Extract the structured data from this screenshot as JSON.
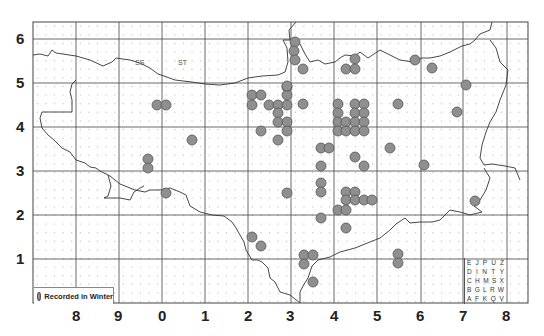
{
  "map": {
    "frame": {
      "left": 33,
      "top": 22,
      "right": 528,
      "bottom": 303
    },
    "grid_x": [
      76,
      119,
      162,
      205,
      248,
      291,
      334,
      377,
      421,
      463,
      507
    ],
    "grid_y": [
      39,
      83,
      127,
      171,
      215,
      259
    ],
    "x_labels": [
      {
        "text": "8",
        "x": 77
      },
      {
        "text": "9",
        "x": 119
      },
      {
        "text": "0",
        "x": 163
      },
      {
        "text": "1",
        "x": 206
      },
      {
        "text": "2",
        "x": 249
      },
      {
        "text": "3",
        "x": 291
      },
      {
        "text": "4",
        "x": 335
      },
      {
        "text": "5",
        "x": 378
      },
      {
        "text": "6",
        "x": 421
      },
      {
        "text": "7",
        "x": 464
      },
      {
        "text": "8",
        "x": 507
      }
    ],
    "y_labels": [
      {
        "text": "6",
        "y": 39
      },
      {
        "text": "5",
        "y": 83
      },
      {
        "text": "4",
        "y": 127
      },
      {
        "text": "3",
        "y": 171
      },
      {
        "text": "2",
        "y": 215
      },
      {
        "text": "1",
        "y": 259
      }
    ],
    "square_labels": [
      {
        "text": "SS",
        "x": 140,
        "y": 64
      },
      {
        "text": "ST",
        "x": 183,
        "y": 64
      }
    ],
    "colors": {
      "dot_fill": "#8f8f8f",
      "dot_stroke": "#555555",
      "grid": "#444444",
      "subgrid_dot": "#c8c8c8",
      "boundary": "#333333"
    },
    "records": [
      [
        157,
        105
      ],
      [
        166,
        105
      ],
      [
        192,
        140
      ],
      [
        148,
        159
      ],
      [
        148,
        168
      ],
      [
        166,
        193
      ],
      [
        252,
        95
      ],
      [
        261,
        95
      ],
      [
        252,
        105
      ],
      [
        269,
        105
      ],
      [
        278,
        105
      ],
      [
        287,
        105
      ],
      [
        287,
        87
      ],
      [
        287,
        95
      ],
      [
        278,
        113
      ],
      [
        278,
        122
      ],
      [
        287,
        122
      ],
      [
        287,
        131
      ],
      [
        261,
        131
      ],
      [
        278,
        140
      ],
      [
        287,
        193
      ],
      [
        252,
        237
      ],
      [
        261,
        246
      ],
      [
        295,
        42
      ],
      [
        294,
        51
      ],
      [
        295,
        60
      ],
      [
        303,
        69
      ],
      [
        346,
        69
      ],
      [
        355,
        59
      ],
      [
        355,
        69
      ],
      [
        287,
        86
      ],
      [
        303,
        104
      ],
      [
        338,
        104
      ],
      [
        355,
        104
      ],
      [
        364,
        104
      ],
      [
        398,
        104
      ],
      [
        338,
        113
      ],
      [
        355,
        113
      ],
      [
        364,
        113
      ],
      [
        338,
        122
      ],
      [
        346,
        122
      ],
      [
        355,
        122
      ],
      [
        364,
        122
      ],
      [
        338,
        131
      ],
      [
        346,
        131
      ],
      [
        355,
        131
      ],
      [
        364,
        131
      ],
      [
        321,
        148
      ],
      [
        329,
        148
      ],
      [
        390,
        148
      ],
      [
        355,
        157
      ],
      [
        364,
        166
      ],
      [
        321,
        166
      ],
      [
        321,
        183
      ],
      [
        321,
        192
      ],
      [
        346,
        192
      ],
      [
        355,
        192
      ],
      [
        346,
        200
      ],
      [
        355,
        200
      ],
      [
        364,
        200
      ],
      [
        372,
        200
      ],
      [
        338,
        210
      ],
      [
        346,
        210
      ],
      [
        321,
        218
      ],
      [
        346,
        228
      ],
      [
        304,
        255
      ],
      [
        313,
        255
      ],
      [
        304,
        264
      ],
      [
        398,
        254
      ],
      [
        398,
        263
      ],
      [
        313,
        282
      ],
      [
        415,
        60
      ],
      [
        432,
        68
      ],
      [
        466,
        85
      ],
      [
        457,
        112
      ],
      [
        424,
        165
      ],
      [
        475,
        201
      ]
    ]
  },
  "legend": {
    "label": "Recorded in Winter"
  },
  "key": {
    "rows": [
      [
        "E",
        "J",
        "P",
        "U",
        "Z"
      ],
      [
        "D",
        "I",
        "N",
        "T",
        "Y"
      ],
      [
        "C",
        "H",
        "M",
        "S",
        "X"
      ],
      [
        "B",
        "G",
        "L",
        "R",
        "W"
      ],
      [
        "A",
        "F",
        "K",
        "Q",
        "V"
      ]
    ]
  }
}
